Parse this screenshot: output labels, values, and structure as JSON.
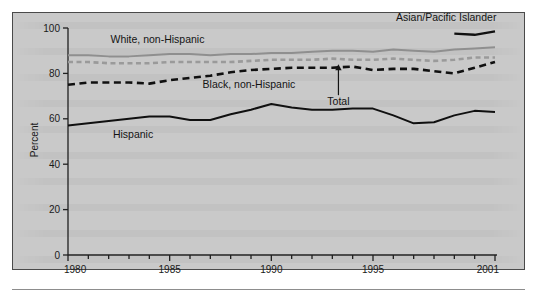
{
  "figure": {
    "panel_background": "#c9c9c9",
    "frame_color": "#4a4a4a"
  },
  "axis": {
    "y_title": "Percent",
    "y_ticks": [
      "0",
      "20",
      "40",
      "60",
      "80",
      "100"
    ],
    "x_ticks_labeled": [
      "1980",
      "1985",
      "1990",
      "1995",
      "2001"
    ]
  },
  "labels": {
    "asian_pacific_islander": "Asian/Pacific Islander",
    "white_non_hispanic": "White, non-Hispanic",
    "black_non_hispanic": "Black, non-Hispanic",
    "hispanic": "Hispanic",
    "total": "Total"
  },
  "colors": {
    "white_non_hispanic": "#8f8f8f",
    "total": "#9a9a9a",
    "black_non_hispanic": "#101010",
    "hispanic": "#101010",
    "asian_pacific_islander": "#101010"
  },
  "chart_data": {
    "type": "line",
    "title": "",
    "xlabel": "",
    "ylabel": "Percent",
    "xlim": [
      1980,
      2001
    ],
    "ylim": [
      0,
      100
    ],
    "grid": false,
    "legend": "inline-annotations",
    "x": [
      1980,
      1981,
      1982,
      1983,
      1984,
      1985,
      1986,
      1987,
      1988,
      1989,
      1990,
      1991,
      1992,
      1993,
      1994,
      1995,
      1996,
      1997,
      1998,
      1999,
      2000,
      2001
    ],
    "series": [
      {
        "name": "White, non-Hispanic",
        "style": "solid",
        "color": "#8f8f8f",
        "values": [
          88,
          88,
          87.5,
          87.5,
          88,
          88.5,
          88.5,
          88,
          88.5,
          88.5,
          89,
          89,
          89.5,
          90,
          90,
          89.5,
          90.5,
          90,
          89.5,
          90.5,
          91,
          91.5
        ]
      },
      {
        "name": "Total",
        "style": "dashed",
        "color": "#9a9a9a",
        "values": [
          85,
          85,
          84.5,
          84.5,
          84.5,
          85,
          85,
          85,
          85,
          85.5,
          86,
          86,
          86,
          86.5,
          86,
          86,
          86.5,
          86,
          85.5,
          86,
          87,
          87
        ]
      },
      {
        "name": "Black, non-Hispanic",
        "style": "dashed",
        "color": "#101010",
        "values": [
          75,
          76,
          76,
          76,
          75.5,
          77,
          78,
          79,
          80.5,
          81.5,
          82,
          82.5,
          82.5,
          82.5,
          83,
          81.5,
          82,
          82,
          81,
          80,
          82.5,
          85
        ]
      },
      {
        "name": "Hispanic",
        "style": "solid",
        "color": "#101010",
        "values": [
          57,
          58,
          59,
          60,
          61,
          61,
          59.5,
          59.5,
          62,
          64,
          66.5,
          65,
          64,
          64,
          64.5,
          64.5,
          61.5,
          58,
          58.5,
          61.5,
          63.5,
          63
        ]
      },
      {
        "name": "Asian/Pacific Islander",
        "style": "solid",
        "color": "#101010",
        "partial_segment_years": [
          1999,
          2001
        ],
        "values_segment": [
          97.5,
          97,
          98.5
        ]
      }
    ],
    "annotations": [
      {
        "text": "Asian/Pacific Islander",
        "x": 1998.6,
        "y": 103
      },
      {
        "text": "White, non-Hispanic",
        "x": 1984.4,
        "y": 93.5
      },
      {
        "text": "Black, non-Hispanic",
        "x": 1988.9,
        "y": 73.5
      },
      {
        "text": "Hispanic",
        "x": 1983.2,
        "y": 51.5
      },
      {
        "text": "Total",
        "x": 1993.3,
        "y": 66,
        "arrow_to_y": 84
      }
    ]
  }
}
